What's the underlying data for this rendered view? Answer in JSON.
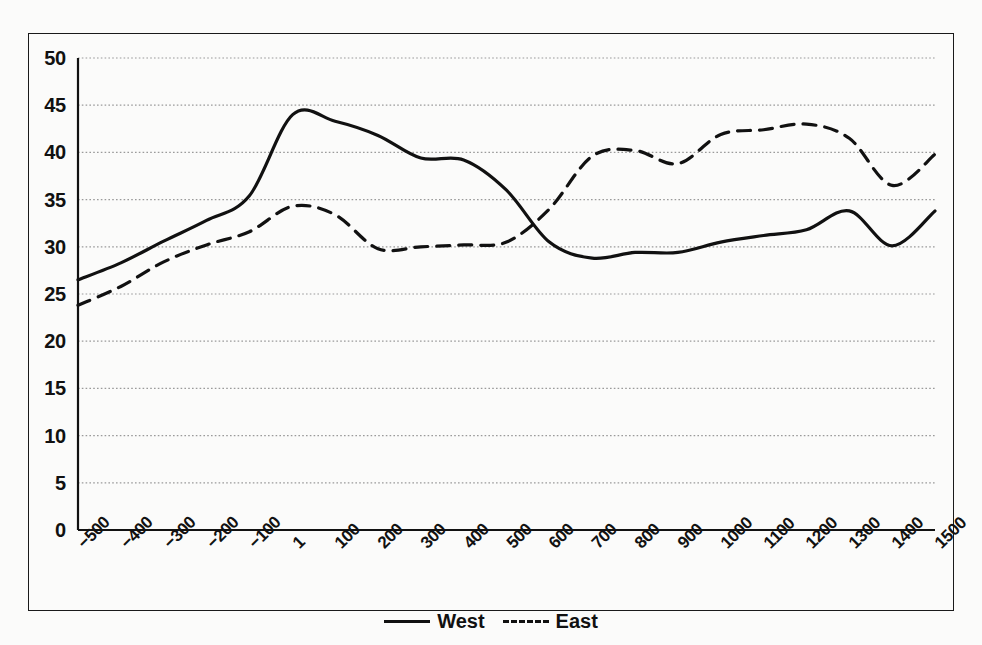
{
  "chart_data": {
    "type": "line",
    "title": "",
    "subtitle": "",
    "xlabel": "",
    "ylabel": "",
    "xlim": [
      -500,
      1500
    ],
    "ylim": [
      0,
      50
    ],
    "grid": true,
    "grid_style": "dotted-horizontal",
    "legend_position": "bottom-center",
    "x": [
      -500,
      -400,
      -300,
      -200,
      -100,
      1,
      100,
      200,
      300,
      400,
      500,
      600,
      700,
      800,
      900,
      1000,
      1100,
      1200,
      1300,
      1400,
      1500
    ],
    "x_tick_labels": [
      "−500",
      "−400",
      "−300",
      "−200",
      "−100",
      "1",
      "100",
      "200",
      "300",
      "400",
      "500",
      "600",
      "700",
      "800",
      "900",
      "1000",
      "1100",
      "1200",
      "1300",
      "1400",
      "1500"
    ],
    "y_tick_labels": [
      "0",
      "5",
      "10",
      "15",
      "20",
      "25",
      "30",
      "35",
      "40",
      "45",
      "50"
    ],
    "y_ticks": [
      0,
      5,
      10,
      15,
      20,
      25,
      30,
      35,
      40,
      45,
      50
    ],
    "series": [
      {
        "name": "West",
        "line_style": "solid",
        "color": "#111111",
        "values": [
          26.5,
          28.3,
          30.6,
          32.8,
          35.4,
          44.0,
          43.3,
          41.8,
          39.4,
          39.2,
          36.0,
          30.5,
          28.8,
          29.4,
          29.4,
          30.5,
          31.2,
          31.8,
          33.8,
          30.1,
          33.8
        ]
      },
      {
        "name": "East",
        "line_style": "dashed",
        "color": "#111111",
        "values": [
          23.8,
          25.8,
          28.4,
          30.2,
          31.6,
          34.3,
          33.4,
          29.8,
          30.0,
          30.2,
          30.5,
          34.0,
          39.6,
          40.2,
          38.8,
          41.9,
          42.4,
          43.0,
          41.5,
          36.5,
          39.8
        ]
      }
    ]
  },
  "legend": {
    "entries": [
      {
        "label": "West",
        "style": "solid"
      },
      {
        "label": "East",
        "style": "dashed"
      }
    ]
  }
}
